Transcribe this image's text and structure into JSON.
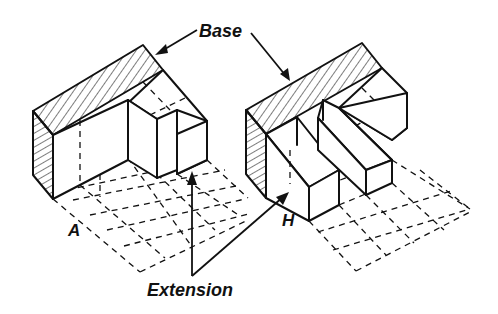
{
  "diagram": {
    "title": "",
    "labels": {
      "base": "Base",
      "extension": "Extension",
      "figure_a": "A",
      "figure_h": "H"
    },
    "figures": [
      {
        "id": "A",
        "description": "Isometric block shaped like letter A footprint: hatched base block along the back with two box extensions projecting forward over a dashed grid",
        "components": [
          "base (hatched top and left face)",
          "extension boxes",
          "dashed floor grid"
        ]
      },
      {
        "id": "H",
        "description": "Isometric block shaped like letter H footprint: hatched base block along the back with two parallel long box extensions projecting forward over a dashed grid",
        "components": [
          "base (hatched top and left face)",
          "extension boxes",
          "dashed floor grid"
        ]
      }
    ],
    "annotations": [
      {
        "text": "Base",
        "points_to": [
          "base of A",
          "base of H"
        ]
      },
      {
        "text": "Extension",
        "points_to": [
          "extension of A",
          "extension of H"
        ]
      }
    ],
    "colors": {
      "ink": "#111111",
      "background": "#ffffff"
    }
  }
}
